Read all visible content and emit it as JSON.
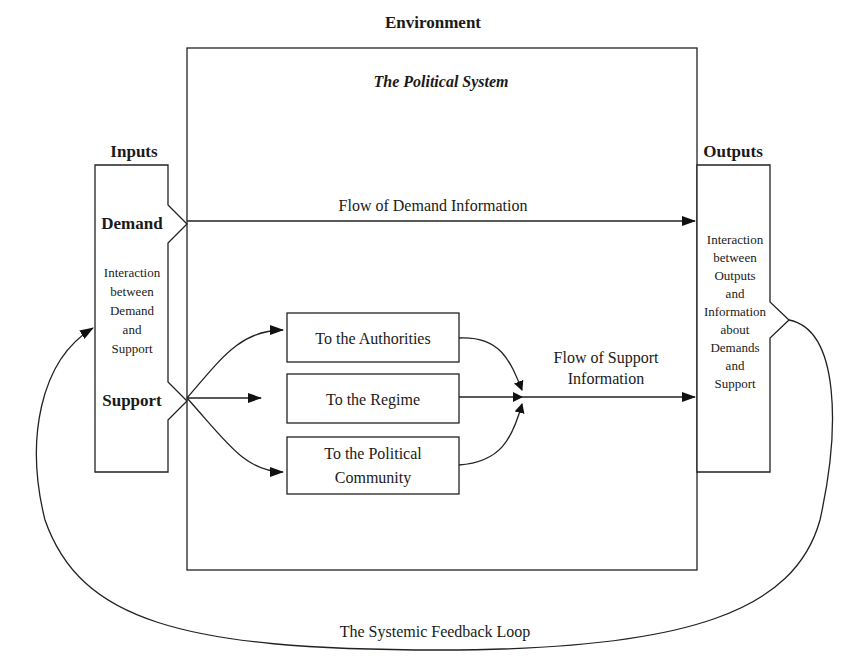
{
  "title": "Environment",
  "system": {
    "label": "The Political System"
  },
  "inputs": {
    "heading": "Inputs",
    "demand": "Demand",
    "support": "Support",
    "interaction": [
      "Interaction",
      "between",
      "Demand",
      "and",
      "Support"
    ]
  },
  "outputs": {
    "heading": "Outputs",
    "interaction": [
      "Interaction",
      "between",
      "Outputs",
      "and",
      "Information",
      "about",
      "Demands",
      "and",
      "Support"
    ]
  },
  "flows": {
    "demand": "Flow of Demand Information",
    "support": [
      "Flow of Support",
      "Information"
    ]
  },
  "targets": [
    {
      "lines": [
        "To the Authorities"
      ]
    },
    {
      "lines": [
        "To the Regime"
      ]
    },
    {
      "lines": [
        "To the Political",
        "Community"
      ]
    }
  ],
  "feedback": "The Systemic Feedback Loop"
}
